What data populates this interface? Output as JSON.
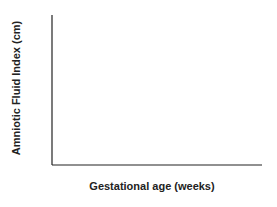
{
  "chart_data": {
    "type": "line",
    "title": "",
    "xlabel": "Gestational age  (weeks)",
    "ylabel": "Amniotic Fluid Index (cm)",
    "xlim": [
      18,
      42
    ],
    "ylim": [
      0,
      28
    ],
    "xticks": [
      18,
      22,
      26,
      30,
      34,
      38,
      42
    ],
    "yticks": [
      0,
      4,
      8,
      12,
      16,
      20,
      24,
      28
    ],
    "grid": false,
    "legend": null,
    "shaded_band": {
      "between": [
        "upper_95",
        "lower_5"
      ],
      "color": "#ececec"
    },
    "x": [
      20,
      22,
      24,
      26,
      28,
      30,
      32,
      34,
      36,
      38,
      40,
      42
    ],
    "series": [
      {
        "name": "outer_upper",
        "values": [
          23,
          23.4,
          23.8,
          24.3,
          25,
          25.9,
          26.8,
          27.4,
          27.5,
          26.7,
          24.3,
          19.2
        ],
        "style": "thin"
      },
      {
        "name": "upper_95",
        "values": [
          20,
          21.6,
          22.8,
          23.7,
          24.3,
          24.5,
          24.4,
          24,
          23.2,
          21.9,
          20.4,
          18.5
        ],
        "style": "thin"
      },
      {
        "name": "upper_inner",
        "values": [
          14,
          15.6,
          16.9,
          17.9,
          18.6,
          19,
          18.9,
          18.3,
          17.2,
          15.7,
          14,
          12.1
        ],
        "style": "thin"
      },
      {
        "name": "median",
        "values": [
          14,
          14.3,
          14.5,
          14.6,
          14.6,
          14.5,
          14.3,
          14,
          13.5,
          12.8,
          12,
          11
        ],
        "style": "bold"
      },
      {
        "name": "lower_inner",
        "values": [
          8.5,
          10.2,
          11.4,
          12.3,
          12.9,
          13.1,
          12.9,
          12.3,
          11.4,
          10.2,
          8.7,
          7
        ],
        "style": "thin"
      },
      {
        "name": "outer_lower",
        "values": [
          8.5,
          8.9,
          9,
          8.9,
          8.6,
          8.2,
          7.7,
          7.2,
          6.8,
          6.5,
          6.3,
          6.3
        ],
        "style": "thin"
      }
    ]
  }
}
